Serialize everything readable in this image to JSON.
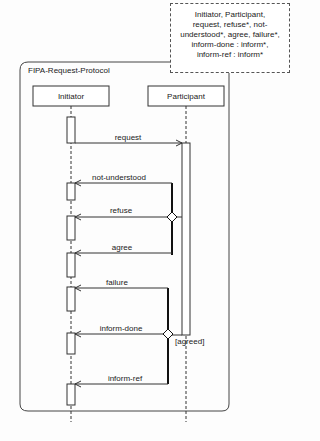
{
  "frame": {
    "title": "FIPA-Request-Protocol"
  },
  "note": {
    "lines": [
      "Initiator, Participant,",
      "request, refuse*, not-",
      "understood*, agree, failure*,",
      "inform-done : inform*,",
      "inform-ref : inform*"
    ]
  },
  "lifelines": [
    {
      "name": "Initiator"
    },
    {
      "name": "Participant"
    }
  ],
  "messages": [
    {
      "label": "request",
      "from": "Initiator",
      "to": "Participant"
    },
    {
      "label": "not-understood",
      "from": "Participant",
      "to": "Initiator"
    },
    {
      "label": "refuse",
      "from": "Participant",
      "to": "Initiator"
    },
    {
      "label": "agree",
      "from": "Participant",
      "to": "Initiator"
    },
    {
      "label": "failure",
      "from": "Participant",
      "to": "Initiator"
    },
    {
      "label": "inform-done",
      "from": "Participant",
      "to": "Initiator"
    },
    {
      "label": "inform-ref",
      "from": "Participant",
      "to": "Initiator"
    }
  ],
  "guards": {
    "agreed": "[agreed]"
  }
}
